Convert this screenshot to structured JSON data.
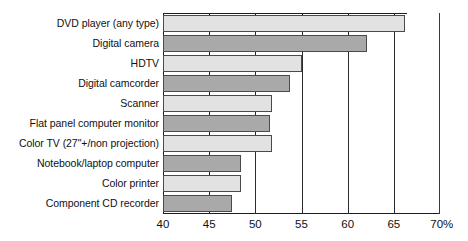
{
  "chart_data": {
    "type": "bar",
    "orientation": "horizontal",
    "title": "",
    "subtitle": "",
    "xlabel": "",
    "ylabel": "",
    "xlim": [
      40,
      70
    ],
    "grid": true,
    "legend": false,
    "legend_position": "none",
    "axis_unit_suffix": "%",
    "xticks": [
      40,
      45,
      50,
      55,
      60,
      65,
      70
    ],
    "xticklabels": [
      "40",
      "45",
      "50",
      "55",
      "60",
      "65",
      "70%"
    ],
    "categories": [
      "DVD player (any type)",
      "Digital camera",
      "HDTV",
      "Digital camcorder",
      "Scanner",
      "Flat panel computer monitor",
      "Color TV (27\"+/non projection)",
      "Notebook/laptop computer",
      "Color printer",
      "Component CD recorder"
    ],
    "values": [
      66.2,
      62.1,
      55.0,
      53.8,
      51.8,
      51.6,
      51.8,
      48.5,
      48.5,
      47.5
    ],
    "bar_colors": [
      "#e2e2e2",
      "#a9a9a9",
      "#e2e2e2",
      "#a9a9a9",
      "#e2e2e2",
      "#a9a9a9",
      "#e2e2e2",
      "#a9a9a9",
      "#e2e2e2",
      "#a9a9a9"
    ],
    "bar_shades": [
      "light",
      "dark",
      "light",
      "dark",
      "light",
      "dark",
      "light",
      "dark",
      "light",
      "dark"
    ],
    "bar_border_color": "#4a4a4a",
    "axis_color": "#1d1d1d",
    "background_color": "#ffffff"
  }
}
